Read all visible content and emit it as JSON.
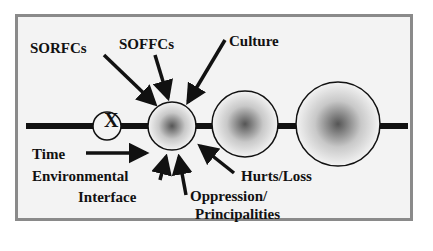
{
  "diagram": {
    "labels": {
      "sorfcs": "SORFCs",
      "soffcs": "SOFFCs",
      "culture": "Culture",
      "time": "Time",
      "env1": "Environmental",
      "env2": "Interface",
      "opp1": "Oppression/",
      "opp2": "Principalities",
      "hurts": "Hurts/Loss"
    },
    "x_marker": "X",
    "colors": {
      "frame_border": "#8a8a8a",
      "background": "#f3f3f3",
      "ink": "#111111"
    }
  }
}
